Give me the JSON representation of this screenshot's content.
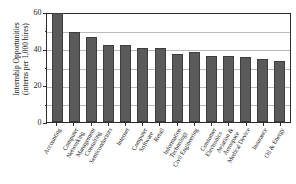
{
  "chart_data": {
    "type": "bar",
    "title": "",
    "xlabel": "",
    "ylabel_line1": "Internship Opportunities",
    "ylabel_line2": "(interns per 1,000 hires)",
    "ylim": [
      0,
      60
    ],
    "yticks_major": [
      "0",
      "20",
      "40",
      "60"
    ],
    "yticks_major_values": [
      0,
      20,
      40,
      60
    ],
    "yticks_minor_values": [
      10,
      30,
      50
    ],
    "grid": "horizontal",
    "legend": "none",
    "bar_color": "#5a5a5a",
    "axis_color": "#2b2b2b",
    "grid_color": "#b9b9b9",
    "categories": [
      "Accounting",
      "Computer Networking",
      "Management Consulting",
      "Semiconductors",
      "Internet",
      "Computer Software",
      "Retail",
      "Information Technology",
      "Civil Engineering",
      "Consumer Electronics",
      "Aviation & Aerospace",
      "Medical Device",
      "Insurance",
      "Oil & Energy"
    ],
    "categories_wrapped": [
      [
        "Accounting"
      ],
      [
        "Computer",
        "Networking"
      ],
      [
        "Management",
        "Consulting"
      ],
      [
        "Semiconductors"
      ],
      [
        "Internet"
      ],
      [
        "Computer",
        "Software"
      ],
      [
        "Retail"
      ],
      [
        "Information",
        "Technology"
      ],
      [
        "Civil Engineering"
      ],
      [
        "Consumer",
        "Electronics"
      ],
      [
        "Aviation &",
        "Aerospace"
      ],
      [
        "Medical Device"
      ],
      [
        "Insurance"
      ],
      [
        "Oil & Energy"
      ]
    ],
    "values": [
      59,
      49,
      46,
      42,
      42,
      40,
      40,
      37,
      38,
      36,
      36,
      35,
      34,
      33
    ]
  }
}
